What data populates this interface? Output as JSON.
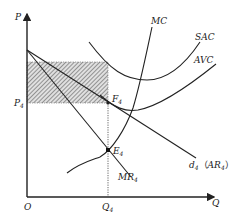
{
  "diagram": {
    "type": "economics-cost-revenue-diagram",
    "axes": {
      "y_label": "P",
      "x_label": "Q",
      "origin_label": "O"
    },
    "price_label": {
      "main": "P",
      "sub": "4"
    },
    "quantity_label": {
      "main": "Q",
      "sub": "4"
    },
    "points": {
      "F": {
        "main": "F",
        "sub": "4"
      },
      "E": {
        "main": "E",
        "sub": "4"
      }
    },
    "curves": {
      "mc": "MC",
      "sac": "SAC",
      "avc": "AVC",
      "mr": {
        "main": "MR",
        "sub": "4"
      },
      "demand": {
        "main": "d",
        "sub": "4",
        "paren_main": "AR",
        "paren_sub": "4"
      }
    },
    "shaded_area": "loss rectangle between average cost and price P4 at output Q4",
    "colors": {
      "line": "#222222",
      "hatch": "#555555",
      "hatch_bg": "#d9d9d9"
    }
  }
}
